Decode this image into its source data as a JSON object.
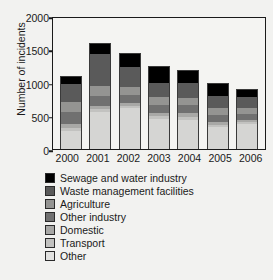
{
  "chart_data": {
    "type": "bar",
    "title": "",
    "xlabel": "",
    "ylabel": "Number of incidents",
    "ylim": [
      0,
      2000
    ],
    "yticks": [
      0,
      500,
      1000,
      1500,
      2000
    ],
    "grid": false,
    "stacked": true,
    "legend_position": "below",
    "categories": [
      "2000",
      "2001",
      "2002",
      "2003",
      "2004",
      "2005",
      "2006"
    ],
    "series": [
      {
        "name": "Other",
        "color": "#d5d5d3",
        "values": [
          270,
          555,
          610,
          455,
          440,
          330,
          370
        ]
      },
      {
        "name": "Transport",
        "color": "#c2c2c0",
        "values": [
          50,
          40,
          35,
          40,
          45,
          30,
          30
        ]
      },
      {
        "name": "Domestic",
        "color": "#a8a8a6",
        "values": [
          60,
          45,
          40,
          45,
          50,
          40,
          35
        ]
      },
      {
        "name": "Other industry",
        "color": "#707070",
        "values": [
          180,
          160,
          125,
          125,
          120,
          115,
          95
        ]
      },
      {
        "name": "Agriculture",
        "color": "#949492",
        "values": [
          140,
          150,
          130,
          110,
          110,
          95,
          85
        ]
      },
      {
        "name": "Waste management facilities",
        "color": "#5a5a5a",
        "values": [
          275,
          480,
          290,
          225,
          230,
          195,
          170
        ]
      },
      {
        "name": "Sewage and water industry",
        "color": "#000000",
        "values": [
          115,
          155,
          200,
          235,
          180,
          170,
          110
        ]
      }
    ],
    "totals": [
      1290,
      1585,
      1430,
      1235,
      1175,
      975,
      895
    ]
  },
  "axis": {
    "y_title": "Number of incidents",
    "y_tick_labels": [
      "0",
      "500",
      "1000",
      "1500",
      "2000"
    ],
    "x_tick_labels": [
      "2000",
      "2001",
      "2002",
      "2003",
      "2004",
      "2005",
      "2006"
    ]
  },
  "legend": {
    "items": [
      {
        "label": "Sewage and water industry",
        "color": "#000000"
      },
      {
        "label": "Waste management facilities",
        "color": "#5a5a5a"
      },
      {
        "label": "Agriculture",
        "color": "#949492"
      },
      {
        "label": "Other industry",
        "color": "#707070"
      },
      {
        "label": "Domestic",
        "color": "#a8a8a6"
      },
      {
        "label": "Transport",
        "color": "#c2c2c0"
      },
      {
        "label": "Other",
        "color": "#e2e2e0"
      }
    ]
  }
}
